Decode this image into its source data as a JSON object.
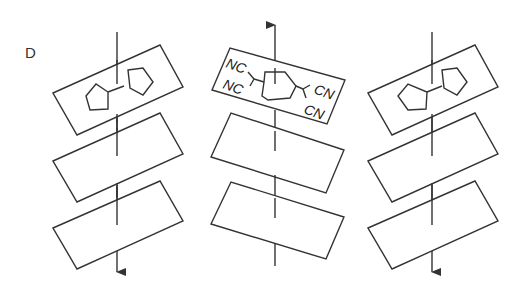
{
  "figure": {
    "panel_label": "D",
    "stroke_color": "#333333",
    "background": "#ffffff"
  },
  "columns": [
    {
      "id": "left",
      "axis_direction": "down",
      "layers": [
        {
          "content": "bicyclopentyl molecule"
        },
        {
          "content": "empty"
        },
        {
          "content": "empty"
        }
      ]
    },
    {
      "id": "middle",
      "axis_direction": "up",
      "layers": [
        {
          "content": "TCNQ-like acceptor molecule",
          "labels": [
            "NC",
            "NC",
            "CN",
            "CN"
          ]
        },
        {
          "content": "empty"
        },
        {
          "content": "empty"
        }
      ]
    },
    {
      "id": "right",
      "axis_direction": "down",
      "layers": [
        {
          "content": "bicyclopentyl molecule"
        },
        {
          "content": "empty"
        },
        {
          "content": "empty"
        }
      ]
    }
  ],
  "labels": {
    "nc_top": "NC",
    "nc_bottom": "NC",
    "cn_top": "CN",
    "cn_bottom": "CN"
  }
}
